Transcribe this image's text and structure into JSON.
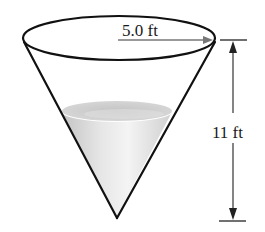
{
  "figure": {
    "type": "cone-tank-diagram",
    "radius_label": "5.0 ft",
    "height_label": "11 ft",
    "dimensions": {
      "radius": 5.0,
      "radius_unit": "ft",
      "height": 11,
      "height_unit": "ft"
    },
    "colors": {
      "outline": "#111111",
      "arrow": "#777777",
      "dimension_line": "#333333",
      "liquid_light": "#f2f2f2",
      "liquid_dark": "#c8c8c8",
      "background": "#ffffff"
    }
  }
}
